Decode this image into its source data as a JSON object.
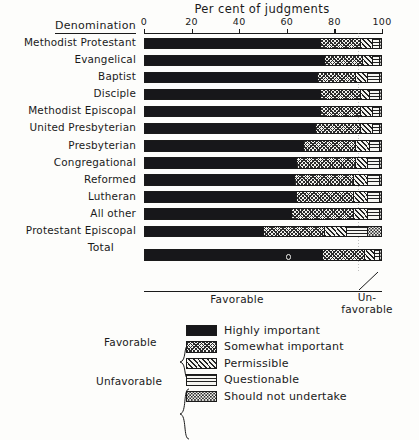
{
  "chart_data": {
    "type": "bar",
    "subtype": "stacked-horizontal-100pct",
    "title": "Per cent of judgments",
    "xlabel": "Per cent of judgments",
    "ylabel": "Denomination",
    "xlim": [
      0,
      100
    ],
    "xticks": [
      0,
      20,
      40,
      60,
      80,
      100
    ],
    "xtick_labels": [
      "0",
      "20",
      "40",
      "60",
      "80",
      "100"
    ],
    "grid": "vertical dotted gridline at 90",
    "legend_position": "below-chart",
    "series": [
      {
        "name": "Highly important",
        "pattern": "solid-black",
        "group": "Favorable",
        "values": [
          74,
          76,
          73,
          74,
          74,
          72,
          67,
          64,
          63,
          64,
          62,
          50,
          75
        ]
      },
      {
        "name": "Somewhat important",
        "pattern": "cross-hatch",
        "group": "Favorable",
        "values": [
          17,
          16,
          16,
          17,
          17,
          19,
          22,
          25,
          25,
          24,
          26,
          26,
          18
        ]
      },
      {
        "name": "Permissible",
        "pattern": "diagonal-hatch",
        "group": "Unfavorable",
        "values": [
          5,
          4,
          5,
          4,
          5,
          5,
          6,
          5,
          6,
          6,
          6,
          9,
          4
        ]
      },
      {
        "name": "Questionable",
        "pattern": "horizontal-lines",
        "group": "Unfavorable",
        "values": [
          3,
          3,
          5,
          4,
          3,
          3,
          4,
          5,
          5,
          5,
          5,
          9,
          2
        ]
      },
      {
        "name": "Should not undertake",
        "pattern": "stipple-dots",
        "group": "Unfavorable",
        "values": [
          1,
          1,
          1,
          1,
          1,
          1,
          1,
          1,
          1,
          1,
          1,
          6,
          1
        ]
      }
    ],
    "categories": [
      "Methodist Protestant",
      "Evangelical",
      "Baptist",
      "Disciple",
      "Methodist Episcopal",
      "United Presbyterian",
      "Presbyterian",
      "Congregational",
      "Reformed",
      "Lutheran",
      "All other",
      "Protestant Episcopal",
      "Total"
    ],
    "annotations": [
      "Favorable",
      "Un-favorable"
    ]
  },
  "header": {
    "denomination_label": "Denomination",
    "title": "Per cent of judgments"
  },
  "axis": {
    "ticks": [
      {
        "value": 0,
        "label": "0"
      },
      {
        "value": 20,
        "label": "20"
      },
      {
        "value": 40,
        "label": "40"
      },
      {
        "value": 60,
        "label": "60"
      },
      {
        "value": 80,
        "label": "80"
      },
      {
        "value": 100,
        "label": "100"
      }
    ]
  },
  "rows": [
    {
      "label": "Methodist Protestant",
      "segments": [
        74,
        17,
        5,
        3,
        1
      ]
    },
    {
      "label": "Evangelical",
      "segments": [
        76,
        16,
        4,
        3,
        1
      ]
    },
    {
      "label": "Baptist",
      "segments": [
        73,
        16,
        5,
        5,
        1
      ]
    },
    {
      "label": "Disciple",
      "segments": [
        74,
        17,
        4,
        4,
        1
      ]
    },
    {
      "label": "Methodist Episcopal",
      "segments": [
        74,
        17,
        5,
        3,
        1
      ]
    },
    {
      "label": "United Presbyterian",
      "segments": [
        72,
        19,
        5,
        3,
        1
      ]
    },
    {
      "label": "Presbyterian",
      "segments": [
        67,
        22,
        6,
        4,
        1
      ]
    },
    {
      "label": "Congregational",
      "segments": [
        64,
        25,
        5,
        5,
        1
      ]
    },
    {
      "label": "Reformed",
      "segments": [
        63,
        25,
        6,
        5,
        1
      ]
    },
    {
      "label": "Lutheran",
      "segments": [
        64,
        24,
        6,
        5,
        1
      ]
    },
    {
      "label": "All other",
      "segments": [
        62,
        26,
        6,
        5,
        1
      ]
    },
    {
      "label": "Protestant Episcopal",
      "segments": [
        50,
        26,
        9,
        9,
        6
      ]
    }
  ],
  "total_row": {
    "label": "Total",
    "segments": [
      75,
      18,
      4,
      2,
      1
    ]
  },
  "footer": {
    "favorable_label": "Favorable",
    "unfavorable_label_line1": "Un-",
    "unfavorable_label_line2": "favorable"
  },
  "legend": {
    "favorable_group_label": "Favorable",
    "unfavorable_group_label": "Unfavorable",
    "items": [
      {
        "label": "Highly important",
        "pattern": "solid-black"
      },
      {
        "label": "Somewhat important",
        "pattern": "cross-hatch"
      },
      {
        "label": "Permissible",
        "pattern": "diagonal-hatch"
      },
      {
        "label": "Questionable",
        "pattern": "horizontal-lines"
      },
      {
        "label": "Should not undertake",
        "pattern": "stipple-dots"
      }
    ]
  },
  "colors": {
    "ink": "#1a1a1a",
    "paper": "#fdfdfb",
    "solid_fill": "#17171a"
  }
}
